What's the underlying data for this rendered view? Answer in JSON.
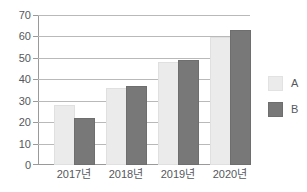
{
  "chart_data": {
    "type": "bar",
    "title": "",
    "subtitle": "",
    "xlabel": "",
    "ylabel": "",
    "categories": [
      "2017년",
      "2018년",
      "2019년",
      "2020년"
    ],
    "series": [
      {
        "name": "A",
        "values": [
          27,
          35,
          47,
          59
        ],
        "color": "#ebebeb"
      },
      {
        "name": "B",
        "values": [
          21,
          36,
          48,
          62
        ],
        "color": "#787878"
      }
    ],
    "ylim": [
      0,
      70
    ],
    "ytick_step": 10,
    "yticks": [
      70,
      60,
      50,
      40,
      30,
      20,
      10,
      0
    ],
    "ytick_labels": [
      "70",
      "60",
      "50",
      "40",
      "30",
      "20",
      "10",
      "0"
    ],
    "grid": true,
    "grid_axis": "y",
    "legend": [
      "A",
      "B"
    ],
    "legend_position": "right",
    "annotations": []
  },
  "legend": {
    "items": [
      {
        "label": "A"
      },
      {
        "label": "B"
      }
    ]
  }
}
